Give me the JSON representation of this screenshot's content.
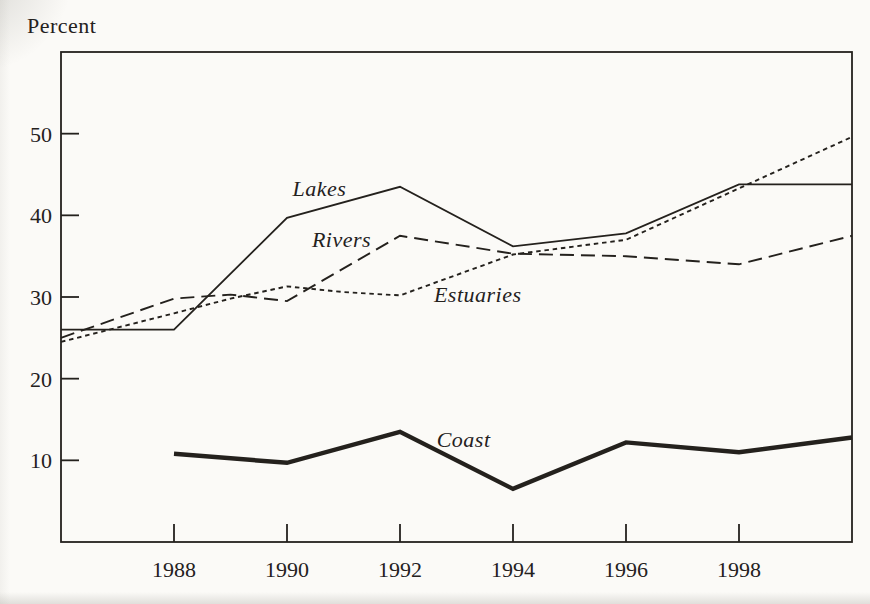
{
  "figure": {
    "kind": "scanned-book-line-chart",
    "ink_color": "#24211d",
    "paper_color": "#fbfaf7"
  },
  "chart_data": {
    "type": "line",
    "title": "",
    "xlabel": "",
    "ylabel": "Percent",
    "xlim": [
      1986,
      2000
    ],
    "ylim": [
      0,
      60
    ],
    "x_ticks": [
      1988,
      1990,
      1992,
      1994,
      1996,
      1998
    ],
    "y_ticks": [
      10,
      20,
      30,
      40,
      50
    ],
    "grid": false,
    "legend": "inline-italic-labels",
    "series": [
      {
        "name": "Lakes",
        "line_style": "solid-thin",
        "points": [
          [
            1986,
            26
          ],
          [
            1988,
            26
          ],
          [
            1990,
            39.7
          ],
          [
            1992,
            43.5
          ],
          [
            1994,
            36.2
          ],
          [
            1996,
            37.8
          ],
          [
            1998,
            43.8
          ],
          [
            2000,
            43.8
          ]
        ],
        "label_pos": [
          1990.1,
          42.4
        ]
      },
      {
        "name": "Rivers",
        "line_style": "long-dash",
        "points": [
          [
            1986,
            25
          ],
          [
            1988,
            29.8
          ],
          [
            1989,
            30.3
          ],
          [
            1990,
            29.5
          ],
          [
            1992,
            37.5
          ],
          [
            1994,
            35.3
          ],
          [
            1996,
            35
          ],
          [
            1998,
            34
          ],
          [
            2000,
            37.5
          ]
        ],
        "label_pos": [
          1990.44,
          36.1
        ]
      },
      {
        "name": "Estuaries",
        "line_style": "short-dash",
        "points": [
          [
            1986,
            24.5
          ],
          [
            1988,
            28
          ],
          [
            1989,
            29.8
          ],
          [
            1990,
            31.3
          ],
          [
            1991,
            30.6
          ],
          [
            1992,
            30.2
          ],
          [
            1994,
            35.2
          ],
          [
            1996,
            37
          ],
          [
            2000,
            49.6
          ]
        ],
        "label_pos": [
          1992.6,
          29.4
        ]
      },
      {
        "name": "Coast",
        "line_style": "solid-thick",
        "points": [
          [
            1988,
            10.8
          ],
          [
            1990,
            9.7
          ],
          [
            1992,
            13.5
          ],
          [
            1994,
            6.5
          ],
          [
            1996,
            12.2
          ],
          [
            1998,
            11
          ],
          [
            2000,
            12.8
          ]
        ],
        "label_pos": [
          1992.65,
          11.6
        ]
      }
    ]
  }
}
